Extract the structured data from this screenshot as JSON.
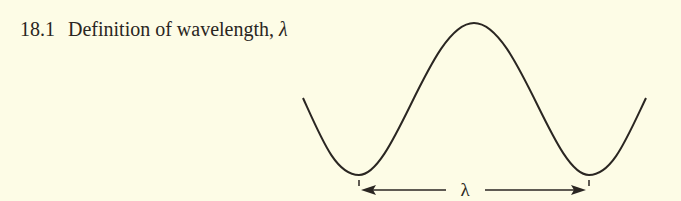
{
  "figure": {
    "number": "18.1",
    "title": "Definition of wavelength,",
    "symbol": "λ"
  },
  "diagram": {
    "wave_label": "λ",
    "colors": {
      "background": "#fdfce6",
      "ink": "#2a2622"
    }
  }
}
